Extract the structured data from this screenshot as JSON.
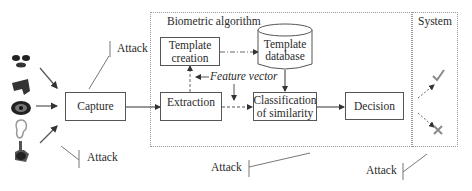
{
  "diagram": {
    "regions": {
      "biometric_algorithm": "Biometric algorithm",
      "system": "System"
    },
    "boxes": {
      "capture": "Capture",
      "template_creation_1": "Template",
      "template_creation_2": "creation",
      "template_database_1": "Template",
      "template_database_2": "database",
      "extraction": "Extraction",
      "classification_1": "Classification",
      "classification_2": "of similarity",
      "decision": "Decision"
    },
    "annotations": {
      "feature_vector": "Feature vector"
    },
    "attacks": [
      "Attack",
      "Attack",
      "Attack",
      "Attack"
    ],
    "biometric_inputs": [
      "face-icon",
      "hand-icon",
      "eye-icon",
      "ear-icon",
      "fingerprint-icon"
    ],
    "outcomes": [
      "accept-check-icon",
      "reject-cross-icon"
    ]
  }
}
